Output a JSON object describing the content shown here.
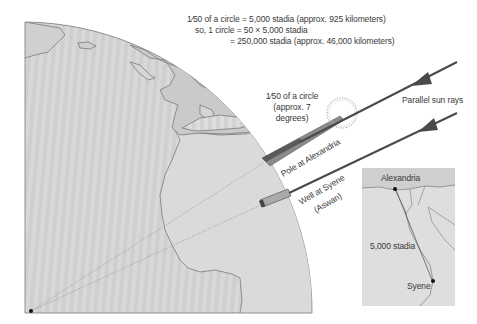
{
  "equation": {
    "line1": "1⁄50 of a circle = 5,000 stadia (approx. 925 kilometers)",
    "line2": "so, 1 circle = 50 × 5,000 stadia",
    "line3": "= 250,000 stadia (approx. 46,000 kilometers)"
  },
  "angle_label": {
    "line1": "1⁄50 of a circle",
    "line2": "(approx. 7",
    "line3": "degrees)"
  },
  "sun_rays_label": "Parallel sun rays",
  "pole_label": "Pole at Alexandria",
  "well_label": {
    "line1": "Well at Syene",
    "line2": "(Aswan)"
  },
  "inset_map": {
    "city_north": "Alexandria",
    "city_south": "Syene",
    "distance": "5,000 stadia"
  },
  "colors": {
    "globe_fill": "#d6d6d6",
    "land_fill": "#c4c4c4",
    "outline": "#6e6e6e",
    "ray": "#4a4a4a",
    "text": "#3a3a3a"
  }
}
